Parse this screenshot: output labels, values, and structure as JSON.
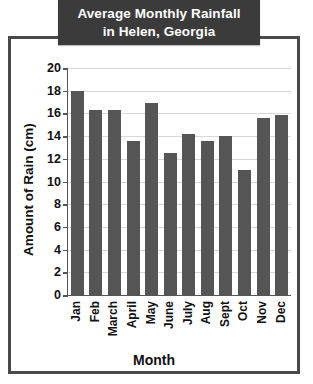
{
  "chart_data": {
    "type": "bar",
    "title": "Average Monthly Rainfall in Helen, Georgia",
    "title_lines": [
      "Average Monthly Rainfall",
      "in Helen, Georgia"
    ],
    "xlabel": "Month",
    "ylabel": "Amount of Rain (cm)",
    "categories": [
      "Jan",
      "Feb",
      "March",
      "April",
      "May",
      "June",
      "July",
      "Aug",
      "Sept",
      "Oct",
      "Nov",
      "Dec"
    ],
    "values": [
      18.0,
      16.3,
      16.3,
      13.6,
      16.9,
      12.5,
      14.2,
      13.6,
      14.0,
      11.0,
      15.6,
      15.9
    ],
    "ylim": [
      0,
      20
    ],
    "yticks": [
      0,
      2,
      4,
      6,
      8,
      10,
      12,
      14,
      16,
      18,
      20
    ],
    "ytick_labels": [
      "0",
      "2",
      "4",
      "6",
      "8",
      "10",
      "12",
      "14",
      "16",
      "18",
      "20"
    ],
    "grid": true,
    "legend": false,
    "bar_color": "#555555",
    "title_background": "#3b3b3b",
    "title_color": "#ffffff",
    "frame_color": "#4a4a4a",
    "gridline_color": "#d8d8d8"
  }
}
